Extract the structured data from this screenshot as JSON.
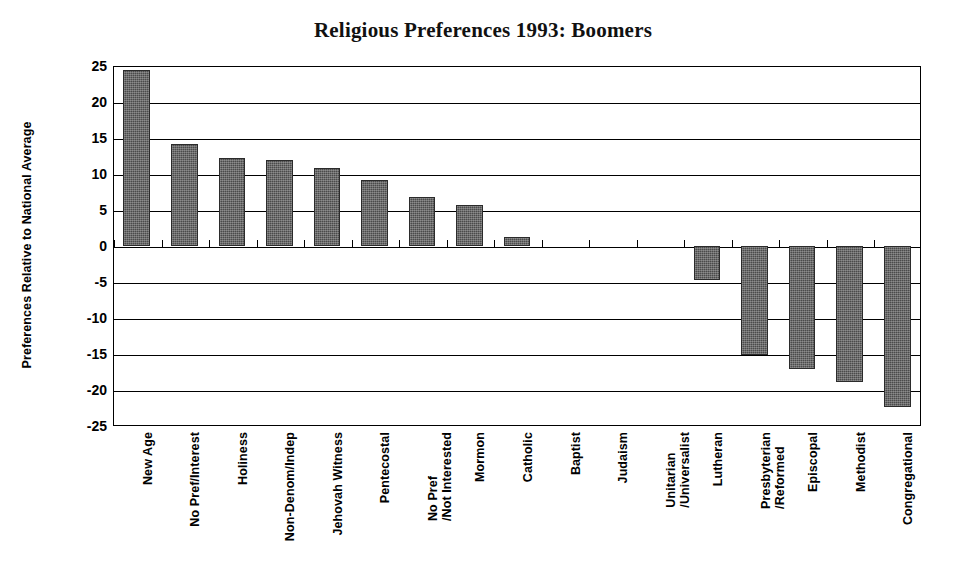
{
  "chart_data": {
    "type": "bar",
    "title": "Religious Preferences 1993: Boomers",
    "xlabel": "",
    "ylabel": "Preferences Relative to National Average",
    "ylim": [
      -25,
      25
    ],
    "ytick_labels": [
      "25",
      "20",
      "15",
      "10",
      "5",
      "0",
      "-5",
      "-10",
      "-15",
      "-20",
      "-25"
    ],
    "yticks": [
      25,
      20,
      15,
      10,
      5,
      0,
      -5,
      -10,
      -15,
      -20,
      -25
    ],
    "grid": true,
    "legend": null,
    "bar_color": "#4b4b4b",
    "categories": [
      "New Age",
      "No Pref/Interest",
      "Holiness",
      "Non-Denom/Indep",
      "Jehovah Witness",
      "Pentecostal",
      "No Pref\n/Not Interested",
      "Mormon",
      "Catholic",
      "Baptist",
      "Judaism",
      "Unitarian\n/Universalist",
      "Lutheran",
      "Presbyterian\n/Reformed",
      "Episcopal",
      "Methodist",
      "Congregational"
    ],
    "values": [
      24.4,
      14.1,
      12.2,
      11.9,
      10.8,
      9.1,
      6.8,
      5.7,
      1.3,
      0,
      0,
      0,
      -4.7,
      -15.1,
      -17.1,
      -18.9,
      -22.3
    ]
  },
  "figure": {
    "background": "#ffffff",
    "axis_color": "#000000"
  }
}
